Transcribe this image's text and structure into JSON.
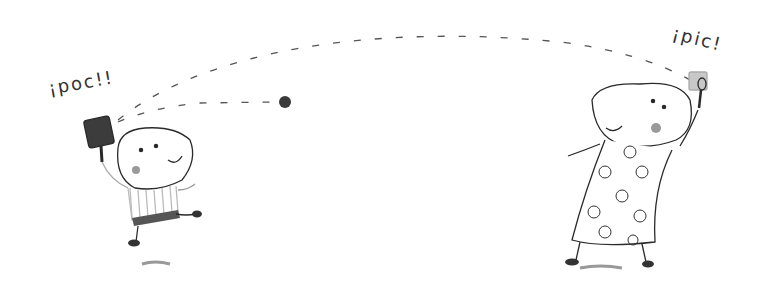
{
  "illustration": {
    "description": "Pencil illustration of two round-headed characters playing paddle ball",
    "captions": {
      "left_character": "¡poc!!",
      "right_character": "¡pic!"
    },
    "characters": [
      {
        "name": "left-character",
        "outfit": "striped shirt, dark shorts",
        "holding": "dark square paddle"
      },
      {
        "name": "right-character",
        "outfit": "flowered dress",
        "holding": "light square paddle"
      }
    ],
    "colors": {
      "line": "#2a2a2a",
      "ball": "#3a3a3a",
      "paddle_dark": "#3c3c3c",
      "paddle_light": "#c8c8c8",
      "cheek": "#9a9a9a"
    }
  }
}
